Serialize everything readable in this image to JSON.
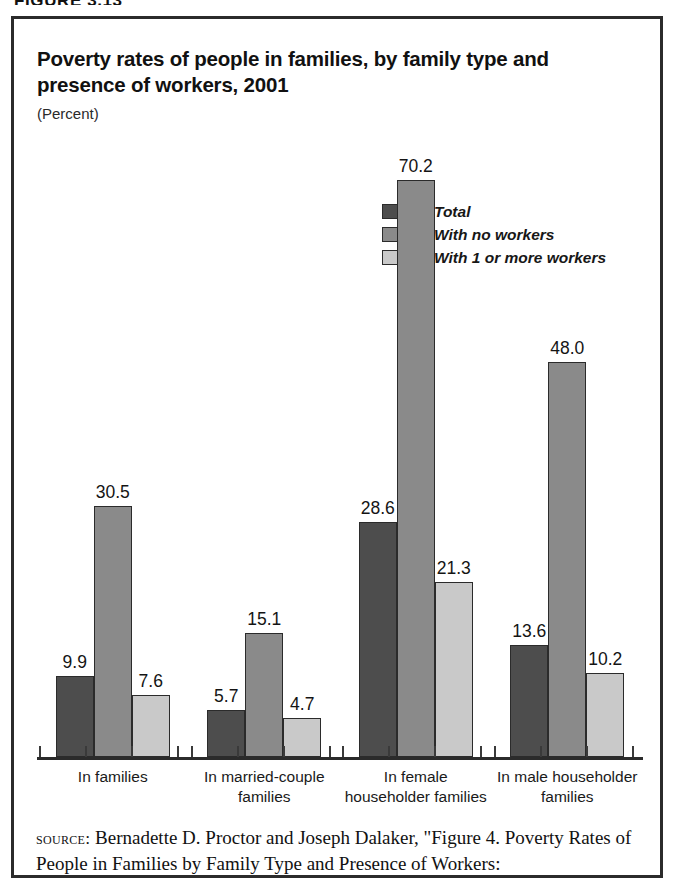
{
  "figure": {
    "caption": "FIGURE 3.13"
  },
  "chart": {
    "title": "Poverty rates of people in families, by family type and presence of workers, 2001",
    "subtitle": "(Percent)"
  },
  "legend": {
    "items": [
      {
        "label": "Total",
        "color": "#4d4d4d"
      },
      {
        "label": "With no workers",
        "color": "#8a8a8a"
      },
      {
        "label": "With 1 or more workers",
        "color": "#c9c9c9"
      }
    ]
  },
  "source": {
    "label": "source:",
    "text": " Bernadette D. Proctor and Joseph Dalaker, \"Figure 4. Poverty Rates of People in Families by Family Type and Presence of Workers:"
  },
  "chart_data": {
    "type": "bar",
    "title": "Poverty rates of people in families, by family type and presence of workers, 2001",
    "subtitle": "(Percent)",
    "xlabel": "",
    "ylabel": "Percent",
    "ylim": [
      0,
      72
    ],
    "grid": false,
    "legend_position": "upper-center-right",
    "categories": [
      "In families",
      "In married-couple families",
      "In female householder families",
      "In male householder families"
    ],
    "series": [
      {
        "name": "Total",
        "color": "#4d4d4d",
        "values": [
          9.9,
          5.7,
          28.6,
          13.6
        ]
      },
      {
        "name": "With no workers",
        "color": "#8a8a8a",
        "values": [
          30.5,
          15.1,
          70.2,
          48.0
        ]
      },
      {
        "name": "With 1 or more workers",
        "color": "#c9c9c9",
        "values": [
          7.6,
          4.7,
          21.3,
          10.2
        ]
      }
    ]
  }
}
